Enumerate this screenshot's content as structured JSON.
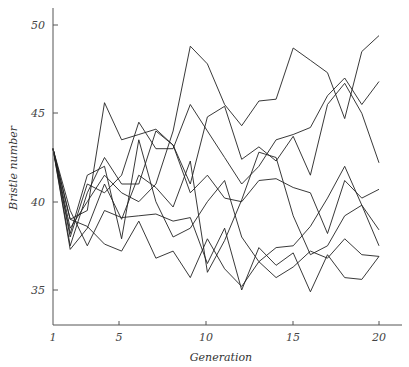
{
  "chart_data": {
    "type": "line",
    "title": "",
    "xlabel": "Generation",
    "ylabel": "Bristle number",
    "x": [
      1,
      2,
      3,
      4,
      5,
      6,
      7,
      8,
      9,
      10,
      11,
      12,
      13,
      14,
      15,
      16,
      17,
      18,
      19,
      20
    ],
    "xlim": [
      1,
      21
    ],
    "ylim": [
      33,
      51
    ],
    "x_ticks": [
      1,
      5,
      10,
      15,
      20
    ],
    "y_ticks": [
      35,
      40,
      45,
      50
    ],
    "grid": false,
    "legend": "none",
    "series": [
      {
        "name": "line 1",
        "values": [
          43,
          38.5,
          40,
          41.5,
          40.5,
          40,
          41,
          44,
          48.8,
          47.8,
          45.5,
          44.3,
          45.7,
          45.8,
          48.7,
          48,
          47.3,
          44.7,
          48.5,
          49.4
        ]
      },
      {
        "name": "line 2",
        "values": [
          43,
          38,
          41,
          40.5,
          41.5,
          44.5,
          43,
          43,
          45.5,
          44,
          42.5,
          41,
          42,
          43.5,
          43.8,
          44.2,
          46,
          47,
          45.5,
          46.8
        ]
      },
      {
        "name": "line 3",
        "values": [
          43,
          39,
          39.5,
          45.6,
          43.5,
          43.8,
          44.1,
          43.2,
          41,
          44.8,
          45.4,
          42.4,
          43.1,
          42.3,
          43.7,
          41.5,
          45.5,
          46.7,
          45,
          42.2
        ]
      },
      {
        "name": "line 4",
        "values": [
          43,
          37.5,
          40.5,
          42.5,
          41,
          41,
          44,
          43.2,
          40.5,
          41.5,
          40.2,
          40,
          41.2,
          41.3,
          40.8,
          40.5,
          38.2,
          41.2,
          40.2,
          40.7
        ]
      },
      {
        "name": "line 5",
        "values": [
          43,
          38.2,
          41.5,
          42,
          37.9,
          43.5,
          40,
          38,
          38.5,
          40,
          41.2,
          38,
          36.6,
          37.4,
          37.5,
          38.6,
          40.2,
          42,
          39.8,
          38.4
        ]
      },
      {
        "name": "line 6",
        "values": [
          43,
          37.3,
          38.5,
          41,
          39,
          41.5,
          40.8,
          39.7,
          42.3,
          36,
          37.8,
          40.1,
          42.8,
          42.5,
          39.2,
          37,
          37.5,
          39.2,
          39.8,
          37.5
        ]
      },
      {
        "name": "line 7",
        "values": [
          43,
          39.5,
          37.5,
          39.5,
          39.1,
          39.2,
          39.3,
          38.9,
          39.1,
          36.5,
          38.5,
          35,
          37.4,
          36.4,
          37.1,
          34.9,
          37,
          35.7,
          35.6,
          36.9
        ]
      },
      {
        "name": "line 8",
        "values": [
          43,
          39,
          38.6,
          37.6,
          37.2,
          38.9,
          36.8,
          37.2,
          35.7,
          37.9,
          36.2,
          35.2,
          36.6,
          35.7,
          36.3,
          37.2,
          36.8,
          37.9,
          37,
          36.9
        ]
      }
    ]
  },
  "axes": {
    "x_title": "Generation",
    "y_title": "Bristle number",
    "x_tick_labels": [
      "1",
      "5",
      "10",
      "15",
      "20"
    ],
    "y_tick_labels": [
      "35",
      "40",
      "45",
      "50"
    ]
  }
}
